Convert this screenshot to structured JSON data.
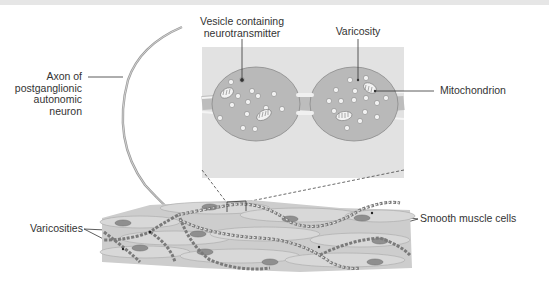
{
  "figure": {
    "type": "anatomical-diagram",
    "labels": {
      "vesicle": [
        "Vesicle containing",
        "neurotransmitter"
      ],
      "varicosity": "Varicosity",
      "axon": [
        "Axon of",
        "postganglionic",
        "autonomic",
        "neuron"
      ],
      "mitochondrion": "Mitochondrion",
      "varicosities": "Varicosities",
      "smooth_muscle": "Smooth muscle cells"
    },
    "colors": {
      "inset_background": "#e2e2e2",
      "varicosity_fill": "#b9b9b9",
      "muscle_fill": "#cfcfcf",
      "nucleus_fill": "#8f8f8f",
      "axon_stroke": "#9a9a9a",
      "leader_line": "#333333"
    }
  }
}
